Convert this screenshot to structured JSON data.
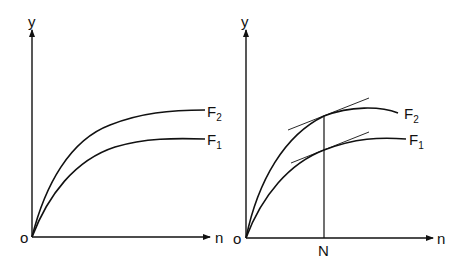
{
  "left_panel": {
    "origin_label": "o",
    "y_axis_label": "y",
    "x_axis_label": "n",
    "curves": [
      {
        "name": "F",
        "subscript": "2"
      },
      {
        "name": "F",
        "subscript": "1"
      }
    ]
  },
  "right_panel": {
    "origin_label": "o",
    "y_axis_label": "y",
    "x_axis_label": "n",
    "marker_label": "N",
    "curves": [
      {
        "name": "F",
        "subscript": "2"
      },
      {
        "name": "F",
        "subscript": "1"
      }
    ]
  }
}
